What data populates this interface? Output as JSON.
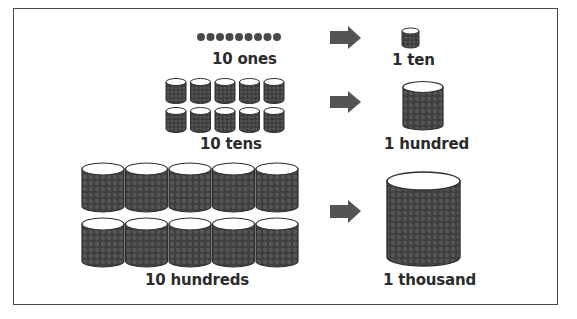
{
  "diagram": {
    "colors": {
      "border": "#4a4a4a",
      "text": "#2b2b2b",
      "fill": "#3e3e3e",
      "arrow": "#545454",
      "container_top": "#ffffff"
    },
    "rows": [
      {
        "left_label": "10 ones",
        "left_icon": "dots",
        "left_count": 10,
        "right_label": "1 ten",
        "right_icon": "small-cylinder"
      },
      {
        "left_label": "10 tens",
        "left_icon": "small-cylinder",
        "left_count": 10,
        "right_label": "1 hundred",
        "right_icon": "medium-cylinder"
      },
      {
        "left_label": "10 hundreds",
        "left_icon": "medium-cylinder",
        "left_count": 10,
        "right_label": "1 thousand",
        "right_icon": "large-cylinder"
      }
    ],
    "arrow_icon": "right-arrow-icon"
  }
}
